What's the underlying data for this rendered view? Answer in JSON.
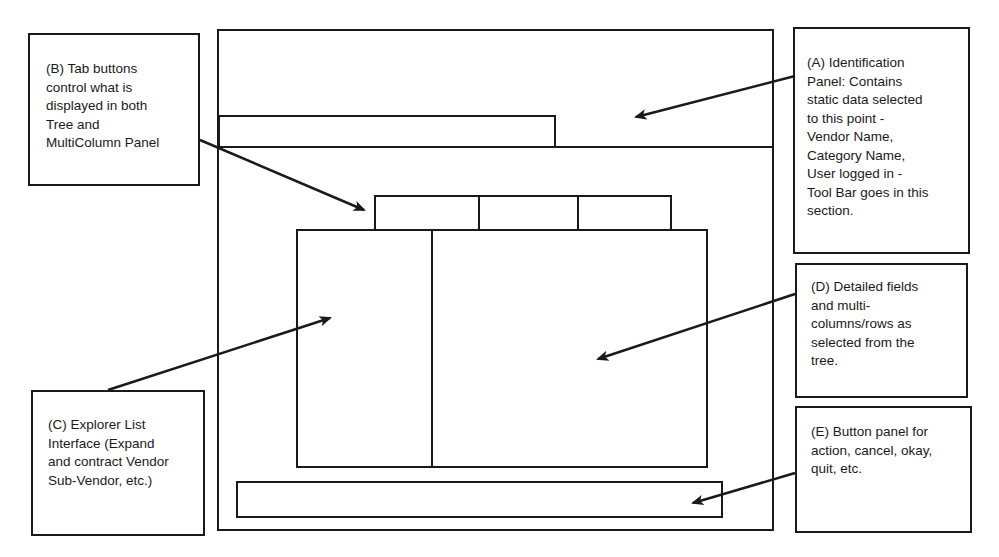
{
  "diagram": {
    "type": "ui-wireframe-annotation",
    "regions": {
      "identification_panel": {
        "label": "A",
        "description": "Identification panel region (top of window)"
      },
      "tab_buttons": {
        "label": "B",
        "count": 3
      },
      "explorer_tree": {
        "label": "C"
      },
      "detail_panel": {
        "label": "D"
      },
      "button_panel": {
        "label": "E"
      }
    }
  },
  "callouts": {
    "a": {
      "text": "(A) Identification\nPanel:  Contains\nstatic data selected\nto this point -\nVendor Name,\nCategory Name,\nUser logged in -\nTool Bar goes in this\nsection."
    },
    "b": {
      "text": "(B) Tab buttons\ncontrol what is\ndisplayed in both\nTree and\nMultiColumn Panel"
    },
    "c": {
      "text": "(C) Explorer List\nInterface (Expand\nand contract Vendor\nSub-Vendor, etc.)"
    },
    "d": {
      "text": "(D) Detailed fields\nand multi-\ncolumns/rows as\nselected from the\ntree."
    },
    "e": {
      "text": "(E) Button panel for\naction, cancel, okay,\nquit, etc."
    }
  },
  "colors": {
    "line": "#1a1a1a",
    "background": "#ffffff"
  }
}
